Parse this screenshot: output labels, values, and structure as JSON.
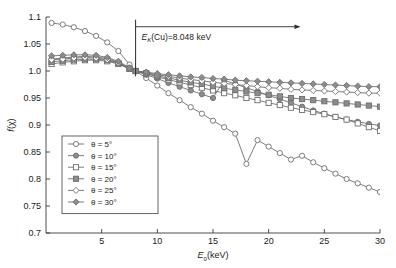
{
  "chart_data": {
    "type": "line",
    "title": "",
    "subtitle": "",
    "xlabel": "E0(keV)",
    "xlabel_parts": {
      "symbol": "E",
      "sub": "0",
      "unit": "(keV)"
    },
    "ylabel": "f(χ)",
    "ylabel_parts": {
      "symbol": "f",
      "arg": "(χ)"
    },
    "xlim": [
      0,
      30
    ],
    "ylim": [
      0.7,
      1.1
    ],
    "grid": false,
    "legend_position": "lower-left-inside",
    "x_ticks": [
      5,
      10,
      15,
      20,
      25,
      30
    ],
    "x_ticklabels": [
      "5",
      "10",
      "15",
      "20",
      "25",
      "30"
    ],
    "y_ticks": [
      0.7,
      0.75,
      0.8,
      0.85,
      0.9,
      0.95,
      1.0,
      1.05,
      1.1
    ],
    "y_ticklabels": [
      "0.7",
      "0.75",
      "0.8",
      "0.85",
      "0.9",
      "0.95",
      "1.0",
      "1.05",
      "1.1"
    ],
    "annotation": {
      "text": "EK(Cu)=8.048 keV",
      "text_parts": {
        "symbol": "E",
        "sub": "K",
        "rest": "(Cu)=8.048 keV"
      },
      "marker_x": 8.048,
      "arrow_direction": "right",
      "arrow_from_x": 8.048,
      "arrow_to_x": 22.5,
      "arrow_y": 1.082,
      "vline_from_y": 0.99,
      "vline_to_y": 1.095
    },
    "x": [
      0.5,
      1.5,
      2.5,
      3.5,
      4.5,
      5.5,
      6.5,
      7.5,
      8.048,
      9,
      10,
      11,
      12,
      13,
      14,
      15,
      16,
      17,
      18,
      19,
      20,
      21,
      22,
      23,
      24,
      25,
      26,
      27,
      28,
      29,
      30
    ],
    "series": [
      {
        "name": "θ = 5°",
        "angle_deg": 5,
        "marker": "circle-open",
        "color": "#6e6e6e",
        "values": [
          1.089,
          1.086,
          1.081,
          1.074,
          1.065,
          1.053,
          1.037,
          1.012,
          1.0,
          0.987,
          0.973,
          0.959,
          0.946,
          0.933,
          0.921,
          0.908,
          0.896,
          0.884,
          0.828,
          0.872,
          0.86,
          0.848,
          0.836,
          0.843,
          0.831,
          0.82,
          0.81,
          0.8,
          0.792,
          0.784,
          0.776
        ]
      },
      {
        "name": "θ = 10°",
        "angle_deg": 10,
        "marker": "circle-filled",
        "color": "#6e6e6e",
        "values": [
          1.022,
          1.024,
          1.026,
          1.027,
          1.026,
          1.023,
          1.016,
          1.005,
          1.0,
          0.993,
          0.986,
          0.978,
          0.971,
          0.964,
          0.957,
          0.95,
          0.983,
          0.976,
          0.969,
          0.962,
          0.955,
          0.948,
          0.941,
          0.934,
          0.927,
          0.921,
          0.915,
          0.91,
          0.906,
          0.902,
          0.899
        ]
      },
      {
        "name": "θ = 15°",
        "angle_deg": 15,
        "marker": "square-open",
        "color": "#6e6e6e",
        "values": [
          1.013,
          1.016,
          1.018,
          1.02,
          1.02,
          1.018,
          1.013,
          1.004,
          1.0,
          0.995,
          0.989,
          0.984,
          0.979,
          0.974,
          0.969,
          0.964,
          0.959,
          0.955,
          0.95,
          0.946,
          0.941,
          0.937,
          0.932,
          0.928,
          0.924,
          0.92,
          0.915,
          0.91,
          0.903,
          0.896,
          0.889
        ]
      },
      {
        "name": "θ = 20°",
        "angle_deg": 20,
        "marker": "square-filled",
        "color": "#6e6e6e",
        "values": [
          1.017,
          1.019,
          1.021,
          1.022,
          1.022,
          1.02,
          1.014,
          1.004,
          1.0,
          0.996,
          0.991,
          0.987,
          0.983,
          0.979,
          0.976,
          0.972,
          0.968,
          0.965,
          0.962,
          0.959,
          0.956,
          0.953,
          0.95,
          0.948,
          0.946,
          0.944,
          0.942,
          0.94,
          0.938,
          0.936,
          0.934
        ]
      },
      {
        "name": "θ = 25°",
        "angle_deg": 25,
        "marker": "diamond-open",
        "color": "#6e6e6e",
        "values": [
          1.021,
          1.022,
          1.024,
          1.025,
          1.024,
          1.021,
          1.015,
          1.005,
          1.0,
          0.997,
          0.993,
          0.99,
          0.987,
          0.984,
          0.982,
          0.979,
          0.977,
          0.975,
          0.973,
          0.971,
          0.969,
          0.968,
          0.966,
          0.965,
          0.964,
          0.963,
          0.962,
          0.961,
          0.96,
          0.959,
          0.959
        ]
      },
      {
        "name": "θ = 30°",
        "angle_deg": 30,
        "marker": "diamond-filled",
        "color": "#6e6e6e",
        "values": [
          1.028,
          1.029,
          1.03,
          1.03,
          1.029,
          1.025,
          1.018,
          1.006,
          1.0,
          0.998,
          0.995,
          0.993,
          0.991,
          0.989,
          0.988,
          0.986,
          0.985,
          0.983,
          0.982,
          0.981,
          0.98,
          0.979,
          0.978,
          0.977,
          0.976,
          0.975,
          0.974,
          0.973,
          0.972,
          0.971,
          0.971
        ]
      }
    ]
  },
  "legend": {
    "items": [
      {
        "label": "θ = 5°"
      },
      {
        "label": "θ = 10°"
      },
      {
        "label": "θ = 15°"
      },
      {
        "label": "θ = 20°"
      },
      {
        "label": "θ = 25°"
      },
      {
        "label": "θ = 30°"
      }
    ]
  },
  "colors": {
    "axis": "#3a3a3a",
    "curve": "#6e6e6e",
    "marker_fill": "#8c8c8c",
    "background": "#ffffff",
    "text": "#1a1a1a"
  }
}
